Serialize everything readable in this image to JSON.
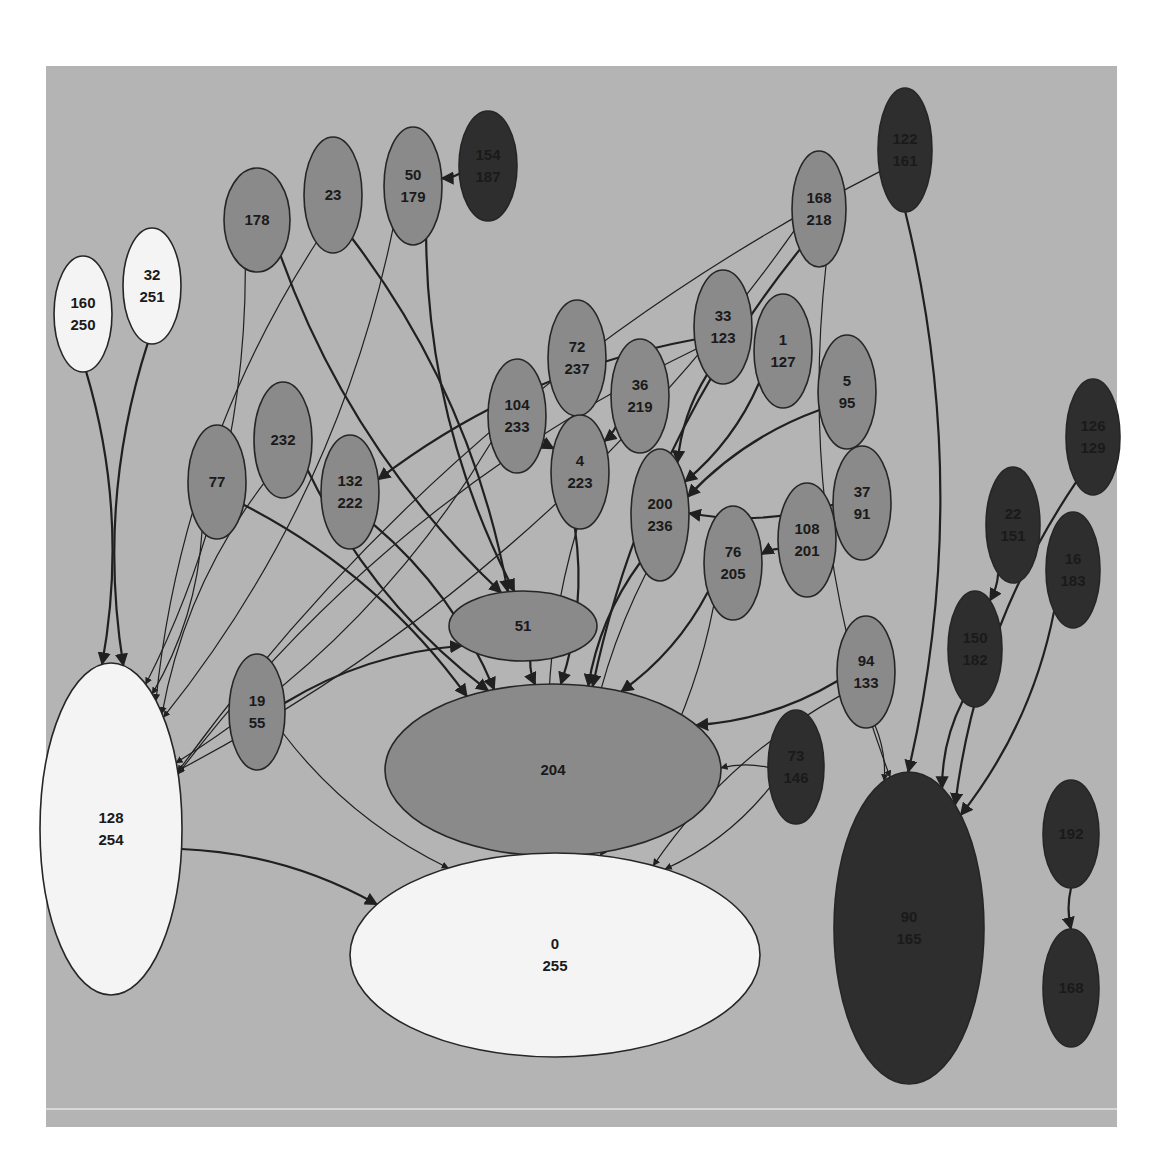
{
  "diagram": {
    "title": "",
    "background": "#b4b4b4",
    "fill_levels": {
      "white": "#f4f4f4",
      "mid": "#8a8a8a",
      "dark": "#2e2e2e"
    },
    "nodes": [
      {
        "id": "178",
        "lines": [
          "178"
        ],
        "cx": 257,
        "cy": 220,
        "rx": 33,
        "ry": 52,
        "shade": "mid"
      },
      {
        "id": "23",
        "lines": [
          "23"
        ],
        "cx": 333,
        "cy": 195,
        "rx": 29,
        "ry": 58,
        "shade": "mid"
      },
      {
        "id": "50_179",
        "lines": [
          "50",
          "179"
        ],
        "cx": 413,
        "cy": 186,
        "rx": 29,
        "ry": 59,
        "shade": "mid"
      },
      {
        "id": "154_187",
        "lines": [
          "154",
          "187"
        ],
        "cx": 488,
        "cy": 166,
        "rx": 29,
        "ry": 55,
        "shade": "dark"
      },
      {
        "id": "122_161",
        "lines": [
          "122",
          "161"
        ],
        "cx": 905,
        "cy": 150,
        "rx": 27,
        "ry": 62,
        "shade": "dark"
      },
      {
        "id": "168_218",
        "lines": [
          "168",
          "218"
        ],
        "cx": 819,
        "cy": 209,
        "rx": 27,
        "ry": 58,
        "shade": "mid"
      },
      {
        "id": "160_250",
        "lines": [
          "160",
          "250"
        ],
        "cx": 83,
        "cy": 314,
        "rx": 29,
        "ry": 58,
        "shade": "white"
      },
      {
        "id": "32_251",
        "lines": [
          "32",
          "251"
        ],
        "cx": 152,
        "cy": 286,
        "rx": 29,
        "ry": 58,
        "shade": "white"
      },
      {
        "id": "33_123",
        "lines": [
          "33",
          "123"
        ],
        "cx": 723,
        "cy": 327,
        "rx": 29,
        "ry": 57,
        "shade": "mid"
      },
      {
        "id": "1_127",
        "lines": [
          "1",
          "127"
        ],
        "cx": 783,
        "cy": 351,
        "rx": 29,
        "ry": 57,
        "shade": "mid"
      },
      {
        "id": "5_95",
        "lines": [
          "5",
          "95"
        ],
        "cx": 847,
        "cy": 392,
        "rx": 29,
        "ry": 57,
        "shade": "mid"
      },
      {
        "id": "72_237",
        "lines": [
          "72",
          "237"
        ],
        "cx": 577,
        "cy": 358,
        "rx": 29,
        "ry": 58,
        "shade": "mid"
      },
      {
        "id": "36_219",
        "lines": [
          "36",
          "219"
        ],
        "cx": 640,
        "cy": 396,
        "rx": 29,
        "ry": 57,
        "shade": "mid"
      },
      {
        "id": "104_233",
        "lines": [
          "104",
          "233"
        ],
        "cx": 517,
        "cy": 416,
        "rx": 29,
        "ry": 57,
        "shade": "mid"
      },
      {
        "id": "4_223",
        "lines": [
          "4",
          "223"
        ],
        "cx": 580,
        "cy": 472,
        "rx": 29,
        "ry": 57,
        "shade": "mid"
      },
      {
        "id": "200_236",
        "lines": [
          "200",
          "236"
        ],
        "cx": 660,
        "cy": 515,
        "rx": 29,
        "ry": 66,
        "shade": "mid"
      },
      {
        "id": "37_91",
        "lines": [
          "37",
          "91"
        ],
        "cx": 862,
        "cy": 503,
        "rx": 29,
        "ry": 57,
        "shade": "mid"
      },
      {
        "id": "108_201",
        "lines": [
          "108",
          "201"
        ],
        "cx": 807,
        "cy": 540,
        "rx": 29,
        "ry": 57,
        "shade": "mid"
      },
      {
        "id": "76_205",
        "lines": [
          "76",
          "205"
        ],
        "cx": 733,
        "cy": 563,
        "rx": 29,
        "ry": 57,
        "shade": "mid"
      },
      {
        "id": "77",
        "lines": [
          "77"
        ],
        "cx": 217,
        "cy": 482,
        "rx": 29,
        "ry": 57,
        "shade": "mid"
      },
      {
        "id": "232",
        "lines": [
          "232"
        ],
        "cx": 283,
        "cy": 440,
        "rx": 29,
        "ry": 58,
        "shade": "mid"
      },
      {
        "id": "132_222",
        "lines": [
          "132",
          "222"
        ],
        "cx": 350,
        "cy": 492,
        "rx": 29,
        "ry": 57,
        "shade": "mid"
      },
      {
        "id": "126_129",
        "lines": [
          "126",
          "129"
        ],
        "cx": 1093,
        "cy": 437,
        "rx": 27,
        "ry": 58,
        "shade": "dark"
      },
      {
        "id": "22_151",
        "lines": [
          "22",
          "151"
        ],
        "cx": 1013,
        "cy": 525,
        "rx": 27,
        "ry": 58,
        "shade": "dark"
      },
      {
        "id": "16_183",
        "lines": [
          "16",
          "183"
        ],
        "cx": 1073,
        "cy": 570,
        "rx": 27,
        "ry": 58,
        "shade": "dark"
      },
      {
        "id": "150_182",
        "lines": [
          "150",
          "182"
        ],
        "cx": 975,
        "cy": 649,
        "rx": 27,
        "ry": 58,
        "shade": "dark"
      },
      {
        "id": "51",
        "lines": [
          "51"
        ],
        "cx": 523,
        "cy": 626,
        "rx": 74,
        "ry": 35,
        "shade": "mid"
      },
      {
        "id": "19_55",
        "lines": [
          "19",
          "55"
        ],
        "cx": 257,
        "cy": 712,
        "rx": 28,
        "ry": 58,
        "shade": "mid"
      },
      {
        "id": "94_133",
        "lines": [
          "94",
          "133"
        ],
        "cx": 866,
        "cy": 672,
        "rx": 29,
        "ry": 56,
        "shade": "mid"
      },
      {
        "id": "73_146",
        "lines": [
          "73",
          "146"
        ],
        "cx": 796,
        "cy": 767,
        "rx": 28,
        "ry": 57,
        "shade": "dark"
      },
      {
        "id": "204",
        "lines": [
          "204"
        ],
        "cx": 553,
        "cy": 770,
        "rx": 168,
        "ry": 86,
        "shade": "mid"
      },
      {
        "id": "128_254",
        "lines": [
          "128",
          "254"
        ],
        "cx": 111,
        "cy": 829,
        "rx": 71,
        "ry": 166,
        "shade": "white"
      },
      {
        "id": "0_255",
        "lines": [
          "0",
          "255"
        ],
        "cx": 555,
        "cy": 955,
        "rx": 205,
        "ry": 102,
        "shade": "white"
      },
      {
        "id": "90_165",
        "lines": [
          "90",
          "165"
        ],
        "cx": 909,
        "cy": 928,
        "rx": 75,
        "ry": 156,
        "shade": "dark"
      },
      {
        "id": "192",
        "lines": [
          "192"
        ],
        "cx": 1071,
        "cy": 834,
        "rx": 28,
        "ry": 54,
        "shade": "dark"
      },
      {
        "id": "168",
        "lines": [
          "168"
        ],
        "cx": 1071,
        "cy": 988,
        "rx": 28,
        "ry": 59,
        "shade": "dark"
      }
    ],
    "edges": [
      {
        "from": "160_250",
        "to": "128_254",
        "w": 2
      },
      {
        "from": "32_251",
        "to": "128_254",
        "w": 2
      },
      {
        "from": "178",
        "to": "128_254",
        "w": 1
      },
      {
        "from": "23",
        "to": "128_254",
        "w": 1
      },
      {
        "from": "50_179",
        "to": "128_254",
        "w": 1
      },
      {
        "from": "122_161",
        "to": "128_254",
        "w": 1
      },
      {
        "from": "168_218",
        "to": "128_254",
        "w": 1
      },
      {
        "from": "33_123",
        "to": "128_254",
        "w": 1
      },
      {
        "from": "77",
        "to": "128_254",
        "w": 1
      },
      {
        "from": "232",
        "to": "128_254",
        "w": 1
      },
      {
        "from": "104_233",
        "to": "128_254",
        "w": 1
      },
      {
        "from": "178",
        "to": "51",
        "w": 2
      },
      {
        "from": "23",
        "to": "51",
        "w": 2
      },
      {
        "from": "50_179",
        "to": "51",
        "w": 2
      },
      {
        "from": "154_187",
        "to": "50_179",
        "w": 2
      },
      {
        "from": "33_123",
        "to": "132_222",
        "w": 2
      },
      {
        "from": "72_237",
        "to": "4_223",
        "w": 2
      },
      {
        "from": "104_233",
        "to": "4_223",
        "w": 2
      },
      {
        "from": "36_219",
        "to": "4_223",
        "w": 2
      },
      {
        "from": "33_123",
        "to": "200_236",
        "w": 2
      },
      {
        "from": "1_127",
        "to": "200_236",
        "w": 2
      },
      {
        "from": "5_95",
        "to": "200_236",
        "w": 2
      },
      {
        "from": "37_91",
        "to": "200_236",
        "w": 2
      },
      {
        "from": "108_201",
        "to": "76_205",
        "w": 2
      },
      {
        "from": "4_223",
        "to": "204",
        "w": 2
      },
      {
        "from": "200_236",
        "to": "204",
        "w": 2
      },
      {
        "from": "76_205",
        "to": "204",
        "w": 2
      },
      {
        "from": "51",
        "to": "204",
        "w": 2
      },
      {
        "from": "77",
        "to": "204",
        "w": 2
      },
      {
        "from": "232",
        "to": "204",
        "w": 2
      },
      {
        "from": "132_222",
        "to": "204",
        "w": 2
      },
      {
        "from": "168_218",
        "to": "204",
        "w": 2
      },
      {
        "from": "94_133",
        "to": "204",
        "w": 2
      },
      {
        "from": "73_146",
        "to": "204",
        "w": 1
      },
      {
        "from": "19_55",
        "to": "51",
        "w": 2
      },
      {
        "from": "19_55",
        "to": "0_255",
        "w": 1
      },
      {
        "from": "128_254",
        "to": "0_255",
        "w": 2
      },
      {
        "from": "200_236",
        "to": "0_255",
        "w": 1
      },
      {
        "from": "76_205",
        "to": "0_255",
        "w": 1
      },
      {
        "from": "4_223",
        "to": "0_255",
        "w": 1
      },
      {
        "from": "73_146",
        "to": "0_255",
        "w": 1
      },
      {
        "from": "94_133",
        "to": "0_255",
        "w": 1
      },
      {
        "from": "122_161",
        "to": "90_165",
        "w": 2
      },
      {
        "from": "168_218",
        "to": "90_165",
        "w": 1
      },
      {
        "from": "94_133",
        "to": "90_165",
        "w": 1
      },
      {
        "from": "150_182",
        "to": "90_165",
        "w": 2
      },
      {
        "from": "16_183",
        "to": "90_165",
        "w": 2
      },
      {
        "from": "126_129",
        "to": "90_165",
        "w": 2
      },
      {
        "from": "22_151",
        "to": "150_182",
        "w": 2
      },
      {
        "from": "192",
        "to": "168",
        "w": 2
      }
    ]
  }
}
